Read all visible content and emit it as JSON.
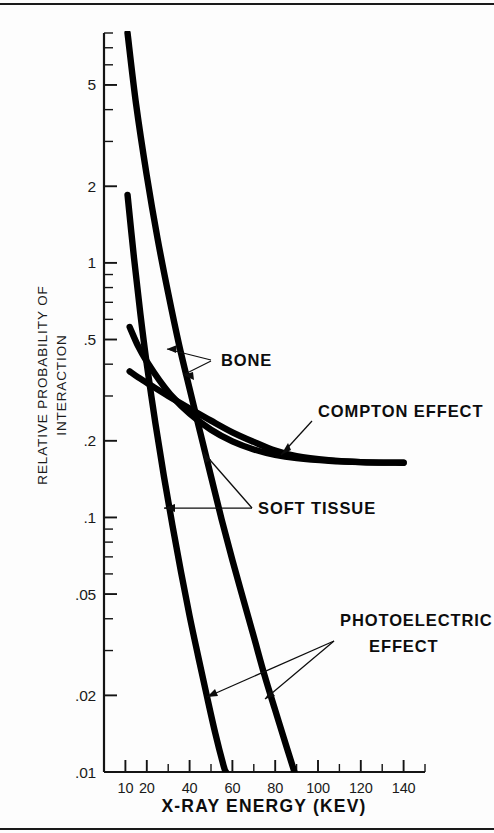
{
  "chart_data": {
    "type": "line",
    "title": "",
    "xlabel": "X-RAY ENERGY (KEV)",
    "ylabel": "RELATIVE PROBABILITY OF INTERACTION",
    "ylabel_line1": "RELATIVE PROBABILITY OF",
    "ylabel_line2": "INTERACTION",
    "xscale": "linear",
    "yscale": "log",
    "xlim": [
      0,
      150
    ],
    "ylim": [
      0.01,
      8
    ],
    "grid": false,
    "legend": "inline-annotations",
    "xticks_labeled": [
      10,
      20,
      40,
      60,
      80,
      100,
      120,
      140
    ],
    "xtick_labels": [
      "10",
      "20",
      "40",
      "60",
      "80",
      "100",
      "120",
      "140"
    ],
    "xticks_minor": [
      30,
      50,
      70,
      90,
      110,
      130,
      150
    ],
    "yticks_labeled": [
      5,
      2,
      1,
      0.5,
      0.2,
      0.1,
      0.05,
      0.02,
      0.01
    ],
    "ytick_labels": [
      "5",
      "2",
      "1",
      ".5",
      ".2",
      ".1",
      ".05",
      ".02",
      ".01"
    ],
    "yticks_minor": [
      8,
      7,
      6,
      4,
      3,
      0.9,
      0.8,
      0.7,
      0.6,
      0.4,
      0.3,
      0.09,
      0.08,
      0.07,
      0.06,
      0.04,
      0.03
    ],
    "series": [
      {
        "name": "PHOTOELECTRIC EFFECT — BONE",
        "label": "PHOTOELECTRIC EFFECT",
        "tissue": "BONE",
        "points": [
          [
            11,
            8.0
          ],
          [
            15,
            4.2
          ],
          [
            20,
            2.2
          ],
          [
            25,
            1.25
          ],
          [
            30,
            0.76
          ],
          [
            35,
            0.48
          ],
          [
            40,
            0.32
          ],
          [
            45,
            0.215
          ],
          [
            50,
            0.145
          ],
          [
            55,
            0.098
          ],
          [
            60,
            0.068
          ],
          [
            65,
            0.048
          ],
          [
            70,
            0.034
          ],
          [
            75,
            0.024
          ],
          [
            80,
            0.0175
          ],
          [
            85,
            0.0128
          ],
          [
            89,
            0.01
          ]
        ]
      },
      {
        "name": "PHOTOELECTRIC EFFECT — SOFT TISSUE",
        "label": "PHOTOELECTRIC EFFECT",
        "tissue": "SOFT TISSUE",
        "points": [
          [
            11,
            1.85
          ],
          [
            14,
            1.05
          ],
          [
            17,
            0.63
          ],
          [
            20,
            0.4
          ],
          [
            24,
            0.235
          ],
          [
            28,
            0.145
          ],
          [
            32,
            0.093
          ],
          [
            36,
            0.061
          ],
          [
            40,
            0.041
          ],
          [
            44,
            0.0285
          ],
          [
            48,
            0.02
          ],
          [
            52,
            0.0142
          ],
          [
            56,
            0.0105
          ],
          [
            57,
            0.01
          ]
        ]
      },
      {
        "name": "COMPTON EFFECT — BONE",
        "label": "COMPTON EFFECT",
        "tissue": "BONE",
        "points": [
          [
            12,
            0.56
          ],
          [
            16,
            0.47
          ],
          [
            20,
            0.41
          ],
          [
            26,
            0.345
          ],
          [
            32,
            0.298
          ],
          [
            40,
            0.256
          ],
          [
            50,
            0.221
          ],
          [
            60,
            0.199
          ],
          [
            70,
            0.185
          ],
          [
            80,
            0.176
          ],
          [
            90,
            0.171
          ],
          [
            105,
            0.167
          ],
          [
            120,
            0.165
          ],
          [
            140,
            0.164
          ]
        ]
      },
      {
        "name": "COMPTON EFFECT — SOFT TISSUE",
        "label": "COMPTON EFFECT",
        "tissue": "SOFT TISSUE",
        "points": [
          [
            12,
            0.375
          ],
          [
            16,
            0.355
          ],
          [
            22,
            0.33
          ],
          [
            30,
            0.3
          ],
          [
            40,
            0.268
          ],
          [
            50,
            0.24
          ],
          [
            60,
            0.216
          ],
          [
            70,
            0.198
          ],
          [
            80,
            0.183
          ],
          [
            90,
            0.174
          ],
          [
            105,
            0.168
          ],
          [
            120,
            0.165
          ],
          [
            140,
            0.164
          ]
        ]
      }
    ],
    "annotations": [
      {
        "text": "BONE",
        "x": 52,
        "y": 0.43
      },
      {
        "text": "COMPTON EFFECT",
        "x": 93,
        "y": 0.33
      },
      {
        "text": "SOFT TISSUE",
        "x": 58,
        "y": 0.082
      },
      {
        "text": "PHOTOELECTRIC",
        "x": 92,
        "y": 0.035
      },
      {
        "text": "EFFECT",
        "x": 100,
        "y": 0.027
      }
    ],
    "colors": {
      "curve": "#000000",
      "axis": "#141414",
      "text": "#1a1a1a",
      "background": "#fdfdfd"
    }
  },
  "figure": {
    "x_axis_title": "X-RAY ENERGY (KEV)",
    "y_axis_title_line1": "RELATIVE PROBABILITY OF",
    "y_axis_title_line2": "INTERACTION",
    "annotation_bone": "BONE",
    "annotation_compton": "COMPTON EFFECT",
    "annotation_soft_tissue": "SOFT TISSUE",
    "annotation_photoelectric_line1": "PHOTOELECTRIC",
    "annotation_photoelectric_line2": "EFFECT"
  }
}
